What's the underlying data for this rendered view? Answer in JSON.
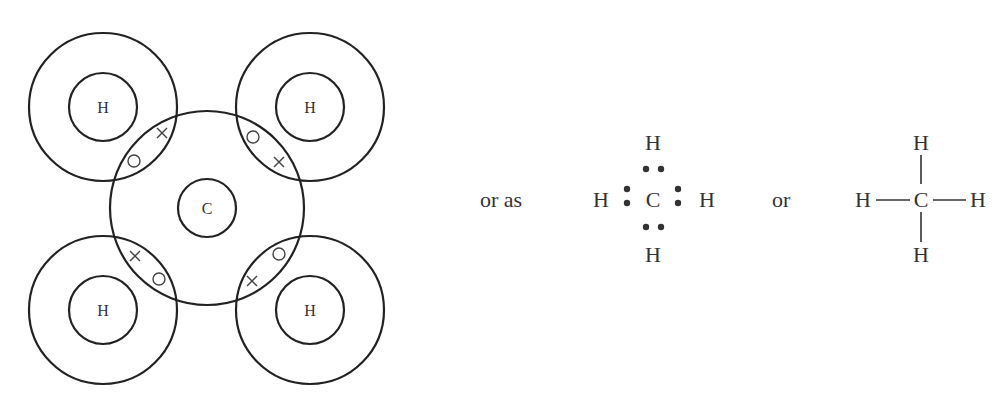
{
  "diagram": {
    "orbital_model": {
      "central_atom": {
        "symbol": "C",
        "cx": 207,
        "cy": 208,
        "inner_r": 29,
        "outer_r": 97
      },
      "hydrogens": [
        {
          "id": "top-left",
          "symbol": "H",
          "cx": 103,
          "cy": 107
        },
        {
          "id": "top-right",
          "symbol": "H",
          "cx": 310,
          "cy": 107
        },
        {
          "id": "bottom-left",
          "symbol": "H",
          "cx": 103,
          "cy": 310
        },
        {
          "id": "bottom-right",
          "symbol": "H",
          "cx": 310,
          "cy": 310
        }
      ],
      "h_inner_r": 34,
      "h_outer_r": 74,
      "electron_markers": {
        "carbon": "×",
        "hydrogen": "○"
      }
    },
    "connector_1": "or as",
    "lewis": {
      "center": "C",
      "top": "H",
      "bottom": "H",
      "left": "H",
      "right": "H",
      "pair_symbol": "••"
    },
    "connector_2": "or",
    "structural": {
      "center": "C",
      "top": "H",
      "bottom": "H",
      "left": "H",
      "right": "H",
      "bond": "—"
    },
    "colors": {
      "stroke": "#222222",
      "text": "#333333",
      "background": "#ffffff"
    }
  }
}
